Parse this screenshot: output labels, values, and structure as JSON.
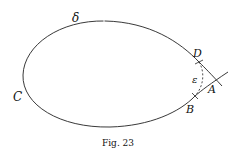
{
  "figure": {
    "caption": "Fig. 23",
    "labels": {
      "delta": "δ",
      "c": "C",
      "d": "D",
      "epsilon": "ε",
      "a": "A",
      "b": "B"
    },
    "colors": {
      "stroke": "#222222",
      "background": "#ffffff"
    }
  }
}
